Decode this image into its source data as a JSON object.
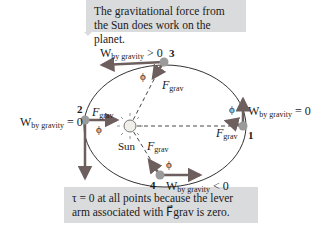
{
  "callouts": {
    "top": "The gravitational force from the Sun does work on the planet.",
    "bottom": "τ = 0 at all points because the lever arm associated with F⃗grav is zero."
  },
  "labels": {
    "sun": "Sun",
    "points": [
      "1",
      "2",
      "3",
      "4"
    ],
    "phi": "ϕ",
    "fgrav": "F",
    "fgrav_sub": "grav",
    "w": "W",
    "w_sub": "by gravity",
    "w1": "= 0",
    "w2": "= 0",
    "w3": "> 0",
    "w4": "< 0"
  },
  "colors": {
    "vector": "#7a6a6a",
    "planet": "#9a9a9a",
    "callout_bg": "#dadbdc"
  }
}
